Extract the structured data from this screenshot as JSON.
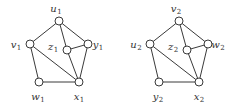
{
  "graphs": [
    {
      "name": "graph-1",
      "nodes": [
        {
          "id": "u1",
          "base": "u",
          "sub": "1"
        },
        {
          "id": "v1",
          "base": "v",
          "sub": "1"
        },
        {
          "id": "z1",
          "base": "z",
          "sub": "1"
        },
        {
          "id": "y1",
          "base": "y",
          "sub": "1"
        },
        {
          "id": "w1",
          "base": "w",
          "sub": "1"
        },
        {
          "id": "x1",
          "base": "x",
          "sub": "1"
        }
      ],
      "edges": [
        [
          "u1",
          "v1"
        ],
        [
          "u1",
          "y1"
        ],
        [
          "u1",
          "z1"
        ],
        [
          "v1",
          "w1"
        ],
        [
          "v1",
          "x1"
        ],
        [
          "w1",
          "x1"
        ],
        [
          "x1",
          "y1"
        ],
        [
          "z1",
          "y1"
        ],
        [
          "z1",
          "x1"
        ]
      ]
    },
    {
      "name": "graph-2",
      "nodes": [
        {
          "id": "v2",
          "base": "v",
          "sub": "2"
        },
        {
          "id": "u2",
          "base": "u",
          "sub": "2"
        },
        {
          "id": "z2",
          "base": "z",
          "sub": "2"
        },
        {
          "id": "w2",
          "base": "w",
          "sub": "2"
        },
        {
          "id": "y2",
          "base": "y",
          "sub": "2"
        },
        {
          "id": "x2",
          "base": "x",
          "sub": "2"
        }
      ],
      "edges": [
        [
          "v2",
          "u2"
        ],
        [
          "v2",
          "w2"
        ],
        [
          "v2",
          "z2"
        ],
        [
          "u2",
          "y2"
        ],
        [
          "u2",
          "x2"
        ],
        [
          "y2",
          "x2"
        ],
        [
          "x2",
          "w2"
        ],
        [
          "z2",
          "w2"
        ],
        [
          "z2",
          "x2"
        ]
      ]
    }
  ]
}
